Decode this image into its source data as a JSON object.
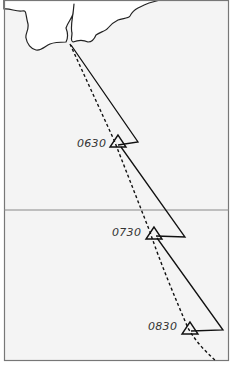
{
  "diagram": {
    "type": "navigation-plot",
    "colors": {
      "sea": "#f4f4f4",
      "land": "#ffffff",
      "border": "#777777",
      "line": "#111111",
      "gridline": "#888888",
      "label": "#333333"
    },
    "fixes": [
      {
        "time": "0630"
      },
      {
        "time": "0730"
      },
      {
        "time": "0830"
      }
    ]
  }
}
